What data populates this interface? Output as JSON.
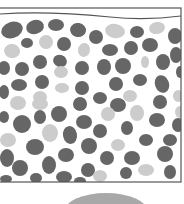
{
  "diagram": {
    "title": "",
    "colors": {
      "background": "#ffffff",
      "border": "#555555",
      "surface_line": "#555555",
      "dark_pebble": "#666666",
      "light_pebble": "#cccccc",
      "mound": "#a8a8a8"
    },
    "box": {
      "x": -2,
      "y": 8,
      "width": 183,
      "height": 174
    },
    "surface_line": "M0,14 C40,11 80,14 110,17 C140,20 165,18 181,16",
    "mound": {
      "cx": 106,
      "cy": 212,
      "rx": 42,
      "ry": 19
    },
    "pebbles": [
      {
        "cx": 12,
        "cy": 30,
        "rx": 11,
        "ry": 8,
        "rot": -20,
        "tone": "dark"
      },
      {
        "cx": 35,
        "cy": 27,
        "rx": 9,
        "ry": 7,
        "rot": -15,
        "tone": "dark"
      },
      {
        "cx": 56,
        "cy": 25,
        "rx": 8,
        "ry": 6,
        "rot": 0,
        "tone": "dark"
      },
      {
        "cx": 78,
        "cy": 30,
        "rx": 8,
        "ry": 7,
        "rot": 10,
        "tone": "dark"
      },
      {
        "cx": 96,
        "cy": 37,
        "rx": 7,
        "ry": 7,
        "rot": 0,
        "tone": "dark"
      },
      {
        "cx": 115,
        "cy": 31,
        "rx": 10,
        "ry": 7,
        "rot": 10,
        "tone": "light"
      },
      {
        "cx": 137,
        "cy": 32,
        "rx": 7,
        "ry": 6,
        "rot": 0,
        "tone": "dark"
      },
      {
        "cx": 157,
        "cy": 28,
        "rx": 8,
        "ry": 6,
        "rot": -10,
        "tone": "light"
      },
      {
        "cx": 175,
        "cy": 36,
        "rx": 7,
        "ry": 8,
        "rot": 0,
        "tone": "dark"
      },
      {
        "cx": 27,
        "cy": 43,
        "rx": 6,
        "ry": 5,
        "rot": 0,
        "tone": "dark"
      },
      {
        "cx": 46,
        "cy": 42,
        "rx": 7,
        "ry": 7,
        "rot": 30,
        "tone": "light"
      },
      {
        "cx": 64,
        "cy": 44,
        "rx": 7,
        "ry": 7,
        "rot": 0,
        "tone": "dark"
      },
      {
        "cx": 12,
        "cy": 51,
        "rx": 8,
        "ry": 7,
        "rot": 10,
        "tone": "light"
      },
      {
        "cx": 84,
        "cy": 50,
        "rx": 6,
        "ry": 7,
        "rot": 10,
        "tone": "light"
      },
      {
        "cx": 110,
        "cy": 50,
        "rx": 8,
        "ry": 6,
        "rot": 0,
        "tone": "dark"
      },
      {
        "cx": 131,
        "cy": 48,
        "rx": 7,
        "ry": 7,
        "rot": 0,
        "tone": "dark"
      },
      {
        "cx": 150,
        "cy": 45,
        "rx": 8,
        "ry": 7,
        "rot": 0,
        "tone": "dark"
      },
      {
        "cx": 176,
        "cy": 55,
        "rx": 6,
        "ry": 8,
        "rot": 0,
        "tone": "dark"
      },
      {
        "cx": 40,
        "cy": 62,
        "rx": 7,
        "ry": 7,
        "rot": 0,
        "tone": "dark"
      },
      {
        "cx": 60,
        "cy": 61,
        "rx": 7,
        "ry": 6,
        "rot": 20,
        "tone": "dark"
      },
      {
        "cx": 145,
        "cy": 62,
        "rx": 4,
        "ry": 6,
        "rot": 0,
        "tone": "light"
      },
      {
        "cx": 163,
        "cy": 62,
        "rx": 7,
        "ry": 8,
        "rot": 0,
        "tone": "dark"
      },
      {
        "cx": 4,
        "cy": 68,
        "rx": 6,
        "ry": 7,
        "rot": 0,
        "tone": "dark"
      },
      {
        "cx": 22,
        "cy": 69,
        "rx": 7,
        "ry": 7,
        "rot": 0,
        "tone": "dark"
      },
      {
        "cx": 82,
        "cy": 68,
        "rx": 7,
        "ry": 7,
        "rot": 0,
        "tone": "dark"
      },
      {
        "cx": 104,
        "cy": 67,
        "rx": 7,
        "ry": 8,
        "rot": 0,
        "tone": "dark"
      },
      {
        "cx": 123,
        "cy": 66,
        "rx": 8,
        "ry": 8,
        "rot": 0,
        "tone": "dark"
      },
      {
        "cx": 61,
        "cy": 72,
        "rx": 7,
        "ry": 6,
        "rot": 0,
        "tone": "light"
      },
      {
        "cx": 180,
        "cy": 72,
        "rx": 4,
        "ry": 6,
        "rot": 0,
        "tone": "dark"
      },
      {
        "cx": 19,
        "cy": 85,
        "rx": 8,
        "ry": 6,
        "rot": 0,
        "tone": "dark"
      },
      {
        "cx": 42,
        "cy": 82,
        "rx": 7,
        "ry": 7,
        "rot": 0,
        "tone": "dark"
      },
      {
        "cx": 62,
        "cy": 88,
        "rx": 7,
        "ry": 5,
        "rot": 0,
        "tone": "light"
      },
      {
        "cx": 82,
        "cy": 88,
        "rx": 7,
        "ry": 7,
        "rot": 0,
        "tone": "dark"
      },
      {
        "cx": 116,
        "cy": 84,
        "rx": 7,
        "ry": 7,
        "rot": 0,
        "tone": "dark"
      },
      {
        "cx": 140,
        "cy": 80,
        "rx": 7,
        "ry": 6,
        "rot": 0,
        "tone": "dark"
      },
      {
        "cx": 162,
        "cy": 84,
        "rx": 7,
        "ry": 9,
        "rot": -20,
        "tone": "dark"
      },
      {
        "cx": 4,
        "cy": 92,
        "rx": 5,
        "ry": 7,
        "rot": 0,
        "tone": "dark"
      },
      {
        "cx": 40,
        "cy": 97,
        "rx": 7,
        "ry": 6,
        "rot": 0,
        "tone": "light"
      },
      {
        "cx": 100,
        "cy": 98,
        "rx": 7,
        "ry": 6,
        "rot": 0,
        "tone": "dark"
      },
      {
        "cx": 130,
        "cy": 96,
        "rx": 7,
        "ry": 6,
        "rot": 0,
        "tone": "light"
      },
      {
        "cx": 160,
        "cy": 102,
        "rx": 7,
        "ry": 7,
        "rot": 0,
        "tone": "dark"
      },
      {
        "cx": 178,
        "cy": 96,
        "rx": 5,
        "ry": 6,
        "rot": 0,
        "tone": "light"
      },
      {
        "cx": 18,
        "cy": 103,
        "rx": 8,
        "ry": 7,
        "rot": 0,
        "tone": "light"
      },
      {
        "cx": 40,
        "cy": 104,
        "rx": 8,
        "ry": 6,
        "rot": 0,
        "tone": "light"
      },
      {
        "cx": 80,
        "cy": 104,
        "rx": 7,
        "ry": 7,
        "rot": 0,
        "tone": "dark"
      },
      {
        "cx": 118,
        "cy": 105,
        "rx": 8,
        "ry": 7,
        "rot": 0,
        "tone": "dark"
      },
      {
        "cx": 180,
        "cy": 112,
        "rx": 5,
        "ry": 6,
        "rot": 0,
        "tone": "light"
      },
      {
        "cx": 4,
        "cy": 117,
        "rx": 5,
        "ry": 6,
        "rot": 0,
        "tone": "dark"
      },
      {
        "cx": 22,
        "cy": 124,
        "rx": 9,
        "ry": 9,
        "rot": 0,
        "tone": "dark"
      },
      {
        "cx": 40,
        "cy": 117,
        "rx": 6,
        "ry": 7,
        "rot": 0,
        "tone": "dark"
      },
      {
        "cx": 59,
        "cy": 114,
        "rx": 8,
        "ry": 8,
        "rot": 0,
        "tone": "dark"
      },
      {
        "cx": 84,
        "cy": 122,
        "rx": 8,
        "ry": 7,
        "rot": 0,
        "tone": "dark"
      },
      {
        "cx": 108,
        "cy": 114,
        "rx": 7,
        "ry": 7,
        "rot": 0,
        "tone": "light"
      },
      {
        "cx": 137,
        "cy": 113,
        "rx": 7,
        "ry": 8,
        "rot": 0,
        "tone": "light"
      },
      {
        "cx": 157,
        "cy": 120,
        "rx": 8,
        "ry": 7,
        "rot": 0,
        "tone": "dark"
      },
      {
        "cx": 178,
        "cy": 125,
        "rx": 6,
        "ry": 7,
        "rot": 0,
        "tone": "dark"
      },
      {
        "cx": 50,
        "cy": 133,
        "rx": 8,
        "ry": 9,
        "rot": 0,
        "tone": "light"
      },
      {
        "cx": 70,
        "cy": 135,
        "rx": 7,
        "ry": 9,
        "rot": -10,
        "tone": "dark"
      },
      {
        "cx": 100,
        "cy": 131,
        "rx": 7,
        "ry": 7,
        "rot": 0,
        "tone": "dark"
      },
      {
        "cx": 127,
        "cy": 128,
        "rx": 6,
        "ry": 7,
        "rot": 0,
        "tone": "dark"
      },
      {
        "cx": 8,
        "cy": 140,
        "rx": 8,
        "ry": 7,
        "rot": 0,
        "tone": "light"
      },
      {
        "cx": 146,
        "cy": 140,
        "rx": 7,
        "ry": 6,
        "rot": 0,
        "tone": "dark"
      },
      {
        "cx": 170,
        "cy": 140,
        "rx": 7,
        "ry": 6,
        "rot": 0,
        "tone": "dark"
      },
      {
        "cx": 35,
        "cy": 147,
        "rx": 9,
        "ry": 8,
        "rot": 0,
        "tone": "dark"
      },
      {
        "cx": 89,
        "cy": 146,
        "rx": 8,
        "ry": 8,
        "rot": 0,
        "tone": "dark"
      },
      {
        "cx": 118,
        "cy": 145,
        "rx": 7,
        "ry": 6,
        "rot": 0,
        "tone": "light"
      },
      {
        "cx": 165,
        "cy": 154,
        "rx": 8,
        "ry": 8,
        "rot": 0,
        "tone": "dark"
      },
      {
        "cx": 7,
        "cy": 158,
        "rx": 7,
        "ry": 9,
        "rot": 0,
        "tone": "dark"
      },
      {
        "cx": 66,
        "cy": 155,
        "rx": 8,
        "ry": 7,
        "rot": 0,
        "tone": "dark"
      },
      {
        "cx": 107,
        "cy": 158,
        "rx": 7,
        "ry": 7,
        "rot": 0,
        "tone": "dark"
      },
      {
        "cx": 132,
        "cy": 158,
        "rx": 8,
        "ry": 7,
        "rot": 0,
        "tone": "dark"
      },
      {
        "cx": 146,
        "cy": 170,
        "rx": 8,
        "ry": 6,
        "rot": 0,
        "tone": "light"
      },
      {
        "cx": 20,
        "cy": 168,
        "rx": 8,
        "ry": 8,
        "rot": 0,
        "tone": "dark"
      },
      {
        "cx": 49,
        "cy": 165,
        "rx": 7,
        "ry": 9,
        "rot": 0,
        "tone": "dark"
      },
      {
        "cx": 88,
        "cy": 170,
        "rx": 7,
        "ry": 7,
        "rot": 0,
        "tone": "dark"
      },
      {
        "cx": 100,
        "cy": 176,
        "rx": 7,
        "ry": 6,
        "rot": 0,
        "tone": "light"
      },
      {
        "cx": 126,
        "cy": 173,
        "rx": 6,
        "ry": 6,
        "rot": 0,
        "tone": "dark"
      },
      {
        "cx": 170,
        "cy": 172,
        "rx": 6,
        "ry": 7,
        "rot": 0,
        "tone": "dark"
      },
      {
        "cx": 36,
        "cy": 178,
        "rx": 6,
        "ry": 5,
        "rot": 0,
        "tone": "dark"
      },
      {
        "cx": 64,
        "cy": 177,
        "rx": 8,
        "ry": 6,
        "rot": 0,
        "tone": "dark"
      },
      {
        "cx": 80,
        "cy": 181,
        "rx": 6,
        "ry": 4,
        "rot": 0,
        "tone": "dark"
      },
      {
        "cx": 6,
        "cy": 179,
        "rx": 6,
        "ry": 4,
        "rot": 0,
        "tone": "dark"
      }
    ]
  }
}
